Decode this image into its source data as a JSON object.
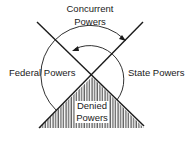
{
  "diagram": {
    "labels": {
      "concurrent_line1": "Concurrent",
      "concurrent_line2": "Powers",
      "federal": "Federal Powers",
      "state": "State Powers",
      "denied_line1": "Denied",
      "denied_line2": "Powers"
    },
    "colors": {
      "ink": "#1a1a1a",
      "background": "#ffffff"
    }
  }
}
